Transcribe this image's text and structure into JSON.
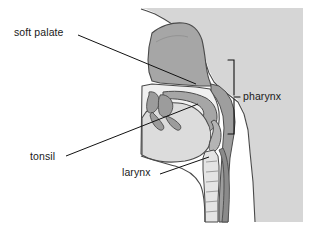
{
  "diagram": {
    "type": "anatomical-illustration",
    "view": "mid-sagittal profile of head and neck, facing left",
    "labels": [
      {
        "id": "soft_palate",
        "text": "soft palate"
      },
      {
        "id": "tonsil",
        "text": "tonsil"
      },
      {
        "id": "larynx",
        "text": "larynx"
      },
      {
        "id": "pharynx",
        "text": "pharynx"
      }
    ],
    "structures": [
      "head outline",
      "nasal cavity",
      "hard palate",
      "soft palate",
      "oral cavity",
      "tongue",
      "tonsil",
      "pharynx",
      "epiglottis",
      "larynx",
      "trachea",
      "esophagus"
    ],
    "annotations": {
      "pharynx_bracket": "vertical brace spanning the pharynx from nasopharynx to laryngopharynx"
    },
    "colors": {
      "page_background": "#ffffff",
      "head_tissue": "#d4d4d4",
      "cavity_mid_gray": "#a8a8a8",
      "cavity_light": "#e8e8e8",
      "airway_white": "#f2f2f2",
      "outline": "#3c3c3c",
      "leader_line": "#111111",
      "label_text": "#1a1a1a"
    }
  }
}
